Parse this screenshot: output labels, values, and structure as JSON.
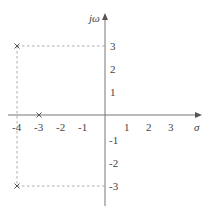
{
  "diagram": {
    "type": "s-plane pole plot",
    "axes": {
      "x_label": "σ",
      "y_label": "jω",
      "x_ticks": [
        "-4",
        "-3",
        "-2",
        "-1",
        "1",
        "2",
        "3"
      ],
      "y_ticks": [
        "3",
        "2",
        "1",
        "-1",
        "-2",
        "-3"
      ]
    },
    "poles": [
      {
        "re": -4,
        "im": 3
      },
      {
        "re": -4,
        "im": -3
      },
      {
        "re": -3,
        "im": 0
      }
    ],
    "colors": {
      "axis": "#777777",
      "text": "#444444",
      "guide": "#999999"
    }
  }
}
